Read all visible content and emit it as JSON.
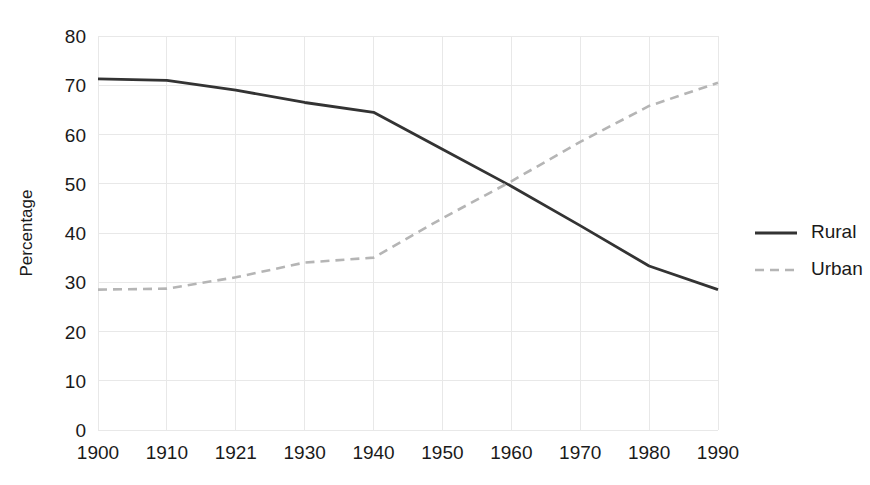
{
  "chart_data": {
    "type": "line",
    "title": "",
    "xlabel": "",
    "ylabel": "Percentage",
    "categories": [
      "1900",
      "1910",
      "1921",
      "1930",
      "1940",
      "1950",
      "1960",
      "1970",
      "1980",
      "1990"
    ],
    "series": [
      {
        "name": "Rural",
        "style": "solid",
        "color": "#333333",
        "values": [
          71.3,
          71.0,
          69.0,
          66.5,
          64.5,
          57.0,
          49.5,
          41.5,
          33.3,
          28.5
        ]
      },
      {
        "name": "Urban",
        "style": "dashed",
        "color": "#b5b5b5",
        "values": [
          28.5,
          28.7,
          31.0,
          34.0,
          35.0,
          43.0,
          50.5,
          58.5,
          65.8,
          70.5
        ]
      }
    ],
    "ylim": [
      0,
      80
    ],
    "y_ticks": [
      "0",
      "10",
      "20",
      "30",
      "40",
      "50",
      "60",
      "70",
      "80"
    ],
    "grid": true,
    "grid_color": "#e8e8e8",
    "legend_position": "right",
    "legend": [
      "Rural",
      "Urban"
    ],
    "background": "#ffffff"
  },
  "axes": {
    "y_title": "Percentage"
  },
  "legend": {
    "entries": [
      {
        "label": "Rural"
      },
      {
        "label": "Urban"
      }
    ]
  }
}
